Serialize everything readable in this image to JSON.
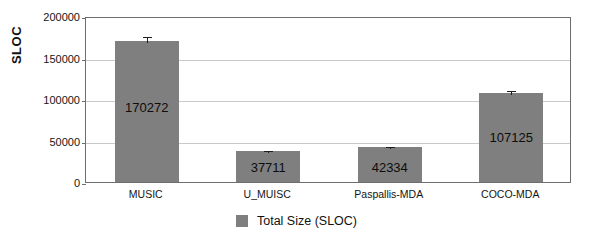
{
  "chart_data": {
    "type": "bar",
    "title": "",
    "xlabel": "",
    "ylabel": "SLOC",
    "categories": [
      "MUSIC",
      "U_MUISC",
      "Paspallis-MDA",
      "COCO-MDA"
    ],
    "values": [
      170272,
      37711,
      42334,
      107125
    ],
    "value_labels": [
      "170272",
      "37711",
      "42334",
      "107125"
    ],
    "errors": [
      7000,
      2200,
      2000,
      4500
    ],
    "series": [
      {
        "name": "Total Size (SLOC)",
        "values": [
          170272,
          37711,
          42334,
          107125
        ],
        "color": "#7f7f7f"
      }
    ],
    "ylim": [
      0,
      200000
    ],
    "yticks": [
      0,
      50000,
      100000,
      150000,
      200000
    ],
    "ytick_labels": [
      "0",
      "50000",
      "100000",
      "150000",
      "200000"
    ],
    "grid": true,
    "grid_axis": "y",
    "legend": {
      "position": "bottom-center",
      "entries": [
        {
          "label": "Total Size (SLOC)",
          "color": "#7f7f7f"
        }
      ]
    },
    "colors": {
      "bar": "#7f7f7f",
      "grid": "#c9c9c9",
      "frame": "#6e6e6e",
      "text": "#111111",
      "background": "#ffffff"
    }
  }
}
